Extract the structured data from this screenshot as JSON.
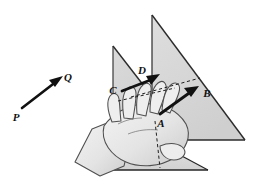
{
  "figure": {
    "background_color": "#ffffff",
    "ink_color": "#1a1a1a",
    "labels": {
      "P": "P",
      "Q": "Q",
      "A": "A",
      "B": "B",
      "C": "C",
      "D": "D"
    },
    "vectors": [
      {
        "name": "PQ",
        "tail_label": "P",
        "head_label": "Q",
        "tail": [
          22,
          108
        ],
        "head": [
          60,
          79
        ],
        "style": "solid-filled-arrow",
        "color": "#111111"
      },
      {
        "name": "CD",
        "tail_label": "C",
        "head_label": "D",
        "tail": [
          122,
          91
        ],
        "head": [
          158,
          76
        ],
        "style": "solid-filled-arrow",
        "color": "#111111"
      },
      {
        "name": "AB",
        "tail_label": "A",
        "head_label": "B",
        "tail": [
          160,
          114
        ],
        "head": [
          197,
          87
        ],
        "style": "solid-filled-arrow",
        "color": "#111111"
      }
    ],
    "label_positions": {
      "P": [
        20,
        118
      ],
      "Q": [
        62,
        79
      ],
      "C": [
        112,
        93
      ],
      "D": [
        140,
        75
      ],
      "A": [
        160,
        126
      ],
      "B": [
        203,
        97
      ]
    },
    "planes": [
      {
        "name": "left-plane",
        "fill": "#d4d4d4",
        "stroke": "#2b2b2b",
        "points": "113,46 113,135 182,135"
      },
      {
        "name": "right-plane",
        "fill": "#d9d9d9",
        "stroke": "#2b2b2b",
        "points": "152,15 152,140 245,140"
      },
      {
        "name": "lower-plane",
        "fill": "#dcdcdc",
        "stroke": "#2b2b2b",
        "points": "96,170 208,170 152,140"
      }
    ],
    "dashed_guides": [
      {
        "name": "guide-d-to-b",
        "from": [
          131,
          97
        ],
        "to": [
          200,
          78
        ]
      },
      {
        "name": "guide-c-to-a",
        "from": [
          118,
          101
        ],
        "to": [
          175,
          88
        ]
      },
      {
        "name": "guide-a-to-base",
        "from": [
          155,
          121
        ],
        "to": [
          160,
          168
        ]
      }
    ],
    "hand": {
      "name": "hand-illustration",
      "fill": "#ececec",
      "stroke": "#4a4a4a",
      "shadow_fill": "#c3c3c3",
      "description": "hand with outstretched fingers grasping and carrying the vector"
    },
    "arrow_head_size": 7
  }
}
